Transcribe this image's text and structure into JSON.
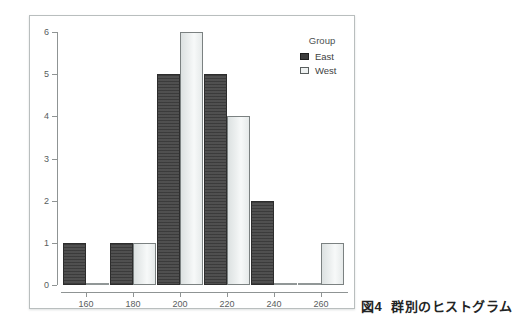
{
  "caption": {
    "label": "図4",
    "text": "群別のヒストグラム"
  },
  "chart_data": {
    "type": "bar",
    "subtype": "grouped-histogram",
    "title": "",
    "xlabel": "",
    "ylabel": "",
    "categories": [
      "160",
      "180",
      "200",
      "220",
      "240",
      "260"
    ],
    "series": [
      {
        "name": "East",
        "color": "#4a4a4a",
        "values": [
          1,
          1,
          5,
          5,
          2,
          0
        ]
      },
      {
        "name": "West",
        "color": "#eef1f1",
        "values": [
          0,
          1,
          6,
          4,
          0,
          1
        ]
      }
    ],
    "legend": {
      "title": "Group",
      "position": "top-right"
    },
    "ylim": [
      0,
      6
    ],
    "yticks": [
      0,
      1,
      2,
      3,
      4,
      5,
      6
    ],
    "grid": false,
    "zero_value_bars_drawn_as_baseline_lines": true
  },
  "colors": {
    "east_bar": "#4a4a4a",
    "west_bar": "#eef1f1",
    "axis": "#8f9494",
    "frame_border": "#b9bebe",
    "background": "#ffffff"
  }
}
